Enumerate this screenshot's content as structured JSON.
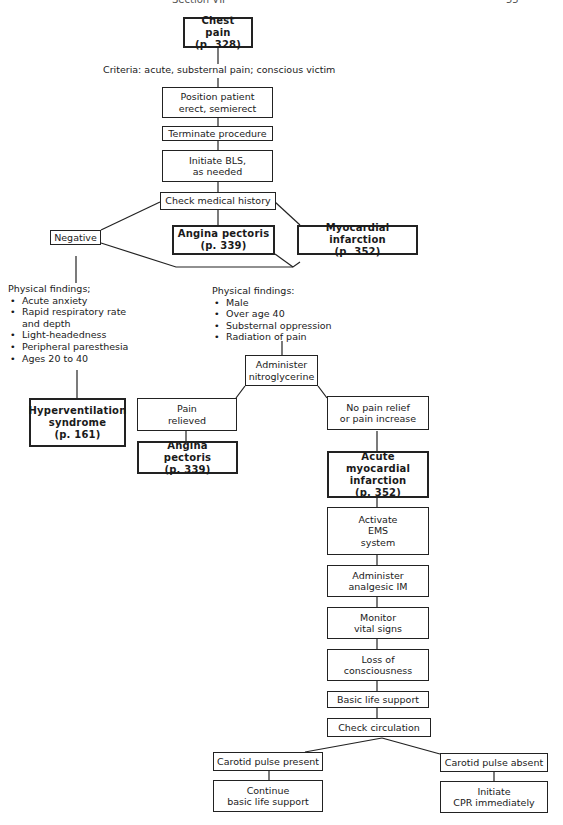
{
  "header": {
    "section": "Section VII",
    "page": "55"
  },
  "nodes": {
    "chest_pain": "Chest pain\n(p. 328)",
    "criteria": "Criteria: acute, substernal pain; conscious victim",
    "position": "Position patient\nerect, semierect",
    "terminate": "Terminate procedure",
    "initiate_bls": "Initiate BLS,\nas needed",
    "check_history": "Check medical history",
    "negative": "Negative",
    "angina_1": "Angina pectoris\n(p. 339)",
    "mi_1": "Myocardial infarction\n(p. 352)",
    "hyperventilation": "Hyperventilation\nsyndrome\n(p. 161)",
    "administer_ntg": "Administer\nnitroglycerine",
    "pain_relieved": "Pain\nrelieved",
    "no_relief": "No pain relief\nor pain increase",
    "angina_2": "Angina pectoris\n(p. 339)",
    "acute_mi": "Acute myocardial\ninfarction\n(p. 352)",
    "activate_ems": "Activate\nEMS\nsystem",
    "analgesic": "Administer\nanalgesic IM",
    "monitor": "Monitor\nvital signs",
    "loss_consciousness": "Loss of\nconsciousness",
    "bls": "Basic life support",
    "check_circulation": "Check circulation",
    "pulse_present": "Carotid pulse present",
    "pulse_absent": "Carotid pulse absent",
    "continue_bls": "Continue\nbasic life support",
    "initiate_cpr": "Initiate\nCPR immediately"
  },
  "findings_left": {
    "title": "Physical findings;",
    "items": [
      "Acute anxiety",
      "Rapid respiratory rate\nand depth",
      "Light-headedness",
      "Peripheral paresthesia",
      "Ages 20 to 40"
    ]
  },
  "findings_right": {
    "title": "Physical findings:",
    "items": [
      "Male",
      "Over age 40",
      "Substernal oppression",
      "Radiation of pain"
    ]
  }
}
